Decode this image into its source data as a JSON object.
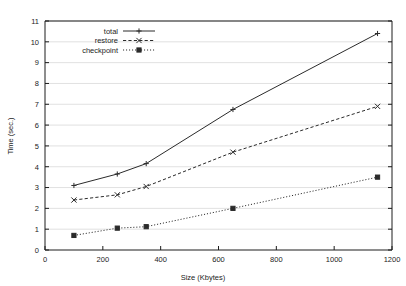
{
  "chart_data": {
    "type": "line",
    "title": "",
    "subtitle": "",
    "xlabel": "Size (Kbytes)",
    "ylabel": "Time (sec.)",
    "xlim": [
      0,
      1200
    ],
    "ylim": [
      0,
      11
    ],
    "xticks": [
      0,
      200,
      400,
      600,
      800,
      1000,
      1200
    ],
    "yticks": [
      0,
      1,
      2,
      3,
      4,
      5,
      6,
      7,
      8,
      9,
      10,
      11
    ],
    "grid": true,
    "grid_axis": "y",
    "legend_position": "top-left-inside",
    "series": [
      {
        "name": "total",
        "marker": "plus",
        "linestyle": "solid",
        "x": [
          100,
          250,
          350,
          650,
          1150
        ],
        "values": [
          3.1,
          3.65,
          4.15,
          6.75,
          10.4
        ]
      },
      {
        "name": "restore",
        "marker": "cross",
        "linestyle": "dashed",
        "x": [
          100,
          250,
          350,
          650,
          1150
        ],
        "values": [
          2.4,
          2.65,
          3.05,
          4.7,
          6.9
        ]
      },
      {
        "name": "checkpoint",
        "marker": "square",
        "linestyle": "dotted",
        "x": [
          100,
          250,
          350,
          650,
          1150
        ],
        "values": [
          0.7,
          1.05,
          1.12,
          2.0,
          3.5
        ]
      }
    ]
  },
  "axes": {
    "x_tick_labels": [
      "0",
      "200",
      "400",
      "600",
      "800",
      "1000",
      "1200"
    ],
    "y_tick_labels": [
      "0",
      "1",
      "2",
      "3",
      "4",
      "5",
      "6",
      "7",
      "8",
      "9",
      "10",
      "11"
    ],
    "x_axis_title": "Size (Kbytes)",
    "y_axis_title": "Time (sec.)"
  },
  "legend": {
    "items": [
      {
        "label": "total"
      },
      {
        "label": "restore"
      },
      {
        "label": "checkpoint"
      }
    ]
  },
  "colors": {
    "line": "#2b2b2b",
    "grid": "#d9d9d9",
    "axis": "#1c1c1c",
    "background": "#ffffff"
  }
}
